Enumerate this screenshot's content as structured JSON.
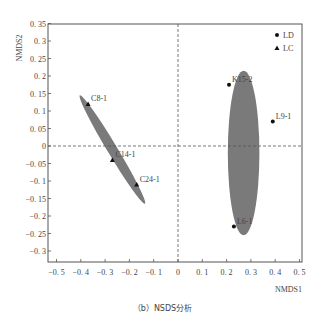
{
  "chart_data": {
    "type": "scatter",
    "title": "",
    "xlabel": "NMDS1",
    "ylabel": "NMDS2",
    "xlim": [
      -0.5,
      0.5
    ],
    "ylim": [
      -0.33,
      0.35
    ],
    "x_ticks": [
      "-0.5",
      "-0.4",
      "-0.3",
      "-0.2",
      "-0.1",
      "0",
      "0.1",
      "0.2",
      "0.3",
      "0.4",
      "0.5"
    ],
    "y_ticks": [
      "0.35",
      "0.3",
      "0.25",
      "0.2",
      "0.15",
      "0.1",
      "0.05",
      "0",
      "-0.05",
      "-0.1",
      "-0.15",
      "-0.2",
      "-0.25",
      "-0.3"
    ],
    "grid": false,
    "reference_lines": {
      "x": 0,
      "y": 0,
      "style": "dashed"
    },
    "legend_position": "top-right",
    "series": [
      {
        "name": "LD",
        "marker": "circle",
        "points": [
          {
            "label": "K15-2",
            "x": 0.21,
            "y": 0.175
          },
          {
            "label": "L9-1",
            "x": 0.39,
            "y": 0.07
          },
          {
            "label": "L6-1",
            "x": 0.23,
            "y": -0.23
          }
        ],
        "ellipse": {
          "cx": 0.27,
          "cy": -0.02,
          "rx": 0.065,
          "ry": 0.235,
          "angle": 0
        }
      },
      {
        "name": "LC",
        "marker": "triangle",
        "points": [
          {
            "label": "C8-1",
            "x": -0.37,
            "y": 0.12
          },
          {
            "label": "C14-1",
            "x": -0.27,
            "y": -0.04
          },
          {
            "label": "C24-1",
            "x": -0.17,
            "y": -0.11
          }
        ],
        "ellipse": {
          "cx": -0.27,
          "cy": -0.01,
          "rx": 0.01,
          "ry": 0.15,
          "angle": -31
        }
      }
    ],
    "ellipse_color": "#7a7a7a"
  },
  "caption": "（b）NSDS分析",
  "legend": {
    "items": [
      {
        "label": "LD"
      },
      {
        "label": "LC"
      }
    ]
  }
}
